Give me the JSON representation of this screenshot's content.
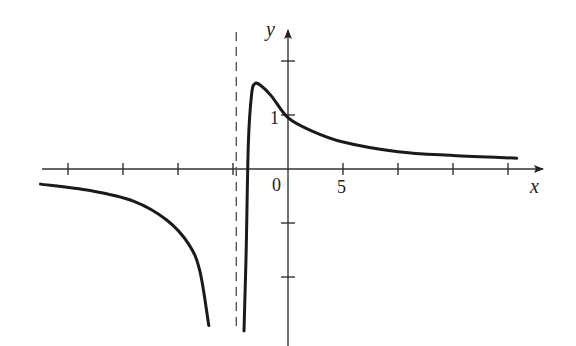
{
  "chart_data": {
    "type": "line",
    "title": "",
    "xlabel": "x",
    "ylabel": "y",
    "x_tick_labels": [
      {
        "value": 0,
        "label": "0"
      },
      {
        "value": 5,
        "label": "5"
      }
    ],
    "y_tick_labels": [
      {
        "value": 1,
        "label": "1"
      }
    ],
    "x_ticks": [
      -20,
      -15,
      -10,
      -5,
      5,
      10,
      15,
      20
    ],
    "y_ticks": [
      -2,
      -1,
      1,
      2
    ],
    "xlim": [
      -22.5,
      23
    ],
    "ylim": [
      -3.0,
      2.6
    ],
    "grid": false,
    "vertical_asymptote": {
      "x": -4.7,
      "style": "dashed"
    },
    "horizontal_asymptote_right": 0.2,
    "horizontal_asymptote_left": -0.3,
    "series": [
      {
        "name": "left-branch",
        "points": [
          [
            -22.5,
            -0.28
          ],
          [
            -18,
            -0.4
          ],
          [
            -14,
            -0.6
          ],
          [
            -11,
            -0.95
          ],
          [
            -9,
            -1.4
          ],
          [
            -8,
            -1.9
          ],
          [
            -7.2,
            -2.9
          ]
        ]
      },
      {
        "name": "right-branch",
        "points": [
          [
            -4.0,
            -3.0
          ],
          [
            -3.8,
            -1.5
          ],
          [
            -3.6,
            0.5
          ],
          [
            -3.3,
            1.4
          ],
          [
            -3.0,
            1.58
          ],
          [
            -2.5,
            1.55
          ],
          [
            -1.5,
            1.35
          ],
          [
            0,
            0.95
          ],
          [
            2,
            0.72
          ],
          [
            5,
            0.5
          ],
          [
            10,
            0.32
          ],
          [
            15,
            0.25
          ],
          [
            20.8,
            0.2
          ]
        ]
      }
    ]
  },
  "labels": {
    "x_axis": "x",
    "y_axis": "y",
    "origin": "0",
    "x_five": "5",
    "y_one": "1"
  }
}
